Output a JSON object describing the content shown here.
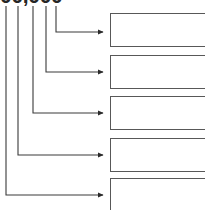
{
  "diagram": {
    "type": "bracket-callout-diagram",
    "background_color": "#ffffff",
    "line_color": "#3a3a3a",
    "box_border_color": "#585858",
    "box_fill_color": "#ffffff",
    "text_color": "#262626",
    "clipped_top_label": "00,000",
    "clipped_top_label_note": "text cropped at top edge of screenshot; only lower portion of glyphs visible",
    "leader_lines": [
      {
        "id": "leader-1",
        "x": 56,
        "turn_y": 32,
        "target_box": 1
      },
      {
        "id": "leader-2",
        "x": 46,
        "turn_y": 72,
        "target_box": 2
      },
      {
        "id": "leader-3",
        "x": 33,
        "turn_y": 113,
        "target_box": 3
      },
      {
        "id": "leader-4",
        "x": 18,
        "turn_y": 155,
        "target_box": 4
      },
      {
        "id": "leader-5",
        "x": 6,
        "turn_y": 195,
        "target_box": 5
      }
    ],
    "boxes": [
      {
        "id": "box-1",
        "label": "",
        "x": 110,
        "y": 13,
        "width": 98,
        "height": 34,
        "clipped": "right"
      },
      {
        "id": "box-2",
        "label": "",
        "x": 110,
        "y": 55,
        "width": 98,
        "height": 34,
        "clipped": "right"
      },
      {
        "id": "box-3",
        "label": "",
        "x": 110,
        "y": 96,
        "width": 98,
        "height": 34,
        "clipped": "right"
      },
      {
        "id": "box-4",
        "label": "",
        "x": 110,
        "y": 138,
        "width": 98,
        "height": 34,
        "clipped": "right"
      },
      {
        "id": "box-5",
        "label": "",
        "x": 110,
        "y": 178,
        "width": 98,
        "height": 34,
        "clipped": "right-bottom"
      }
    ]
  }
}
